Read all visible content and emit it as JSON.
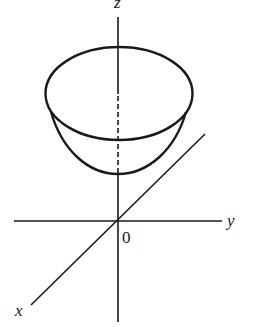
{
  "figure": {
    "axes": {
      "z_label": "z",
      "y_label": "y",
      "x_label": "x",
      "origin_label": "0"
    },
    "surface": {
      "type": "paraboloid",
      "rim": "ellipse",
      "hidden_axis_segment": "dashed"
    },
    "colors": {
      "stroke": "#1a1a1a",
      "background": "#ffffff"
    }
  }
}
